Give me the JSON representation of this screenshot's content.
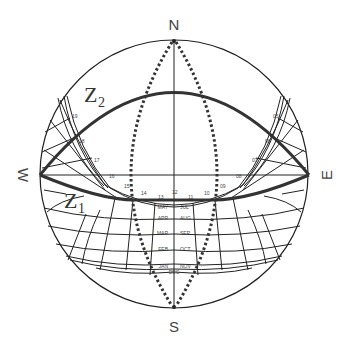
{
  "diagram": {
    "type": "sun-path-stereographic",
    "cardinals": {
      "north": "N",
      "south": "S",
      "west": "W",
      "east": "E"
    },
    "curves": [
      {
        "id": "z2",
        "label": "Z",
        "subscript": "2"
      },
      {
        "id": "z1",
        "label": "Z",
        "subscript": "1"
      }
    ],
    "hour_labels": {
      "left": [
        "19",
        "18",
        "17",
        "16"
      ],
      "bottom": [
        "15",
        "14",
        "13",
        "12",
        "11",
        "10",
        "09"
      ],
      "right": [
        "05",
        "06",
        "07",
        "08"
      ]
    },
    "month_rows": [
      {
        "left": "MAY",
        "right": "JUL"
      },
      {
        "left": "APR",
        "right": "AUG"
      },
      {
        "left": "MAR",
        "right": "SEP"
      },
      {
        "left": "FEB",
        "right": "OCT"
      },
      {
        "left": "JAN",
        "right": "NOV"
      },
      {
        "center": "DEC"
      }
    ],
    "colors": {
      "line": "#222222",
      "heavy": "#333333",
      "background": "#ffffff"
    }
  }
}
